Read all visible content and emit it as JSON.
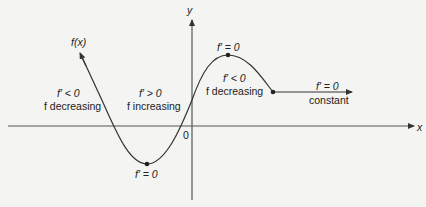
{
  "axes": {
    "x_label": "x",
    "y_label": "y",
    "origin_label": "0"
  },
  "curve": {
    "label": "f(x)",
    "color": "#333333"
  },
  "regions": {
    "left": {
      "derivative": "f′ < 0",
      "behavior": "f decreasing"
    },
    "middle": {
      "derivative": "f′ > 0",
      "behavior": "f increasing"
    },
    "right": {
      "derivative": "f′ < 0",
      "behavior": "f decreasing"
    },
    "constant": {
      "derivative": "f′ = 0",
      "behavior": "constant"
    }
  },
  "critical_points": {
    "minimum": "f′ = 0",
    "maximum": "f′ = 0"
  }
}
